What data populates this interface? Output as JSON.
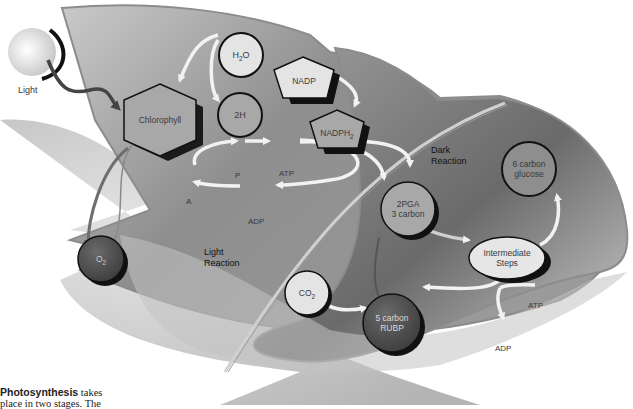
{
  "diagram": {
    "title": "Photosynthesis",
    "light_source": {
      "label": "Light",
      "icon": "sun-with-crescent-icon"
    },
    "light_reaction": {
      "title_line1": "Light",
      "title_line2": "Reaction",
      "nodes": {
        "chlorophyll": "Chlorophyll",
        "h2o": {
          "main": "H",
          "sub": "2",
          "tail": "O"
        },
        "two_h": "2H",
        "nadp": "NADP",
        "nadph2": {
          "main": "NADPH",
          "sub": "2"
        },
        "o2": {
          "main": "O",
          "sub": "2"
        }
      },
      "cycle": {
        "a": "A",
        "p": "P",
        "atp": "ATP",
        "adp": "ADP"
      }
    },
    "dark_reaction": {
      "title_line1": "Dark",
      "title_line2": "Reaction",
      "nodes": {
        "pga_line1": "2PGA",
        "pga_line2": "3 carbon",
        "glucose_line1": "6 carbon",
        "glucose_line2": "glucose",
        "intermediate_line1": "Intermediate",
        "intermediate_line2": "Steps",
        "co2": {
          "main": "CO",
          "sub": "2"
        },
        "rubp_line1": "5 carbon",
        "rubp_line2": "RUBP",
        "atp": "ATP",
        "adp": "ADP"
      }
    },
    "colors": {
      "leaf_light": "#d8d8d8",
      "leaf_mid": "#a8a8a8",
      "leaf_dark": "#6e6e6e",
      "node_light": "#e4e4e4",
      "node_mid": "#a6a6a6",
      "node_dark": "#555555",
      "arrow": "#f0f0f0"
    }
  },
  "caption": {
    "bold": "Photosynthesis",
    "line1_rest": " takes",
    "line2": "place in two stages. The"
  }
}
